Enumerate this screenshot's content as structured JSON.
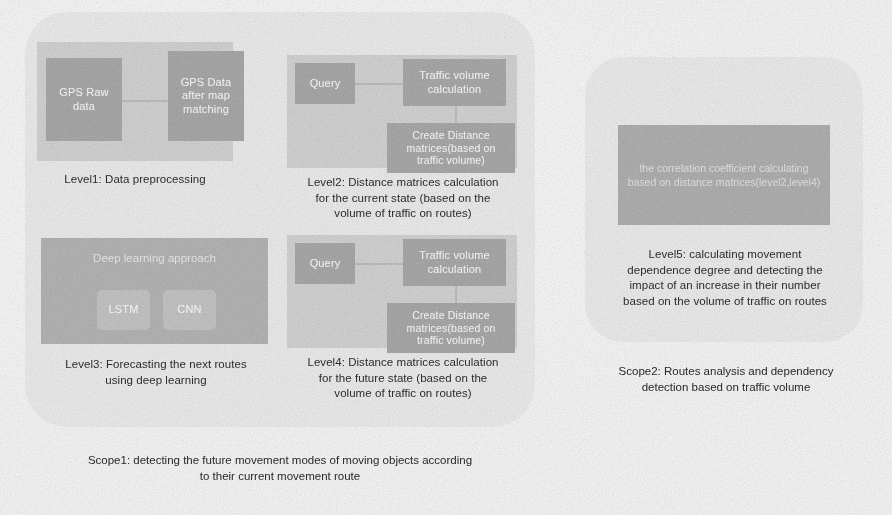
{
  "scope1": {
    "caption_line1": "Scope1: detecting the future movement modes of moving objects according",
    "caption_line2": "to their current movement route",
    "levels": [
      {
        "id": "level1",
        "caption": "Level1: Data preprocessing",
        "nodes": [
          {
            "id": "gps-raw-data",
            "line1": "GPS Raw",
            "line2": "data"
          },
          {
            "id": "gps-data-after-map-matching",
            "line1": "GPS Data",
            "line2": "after map",
            "line3": "matching"
          }
        ]
      },
      {
        "id": "level2",
        "caption_line1": "Level2: Distance matrices calculation",
        "caption_line2": "for the current state (based on the",
        "caption_line3": "volume of traffic on routes)",
        "nodes": [
          {
            "id": "query",
            "line1": "Query"
          },
          {
            "id": "traffic-volume-calculation",
            "line1": "Traffic volume",
            "line2": "calculation"
          },
          {
            "id": "create-distance-matrices",
            "line1": "Create Distance",
            "line2": "matrices(based on",
            "line3": "traffic volume)"
          }
        ]
      },
      {
        "id": "level3",
        "caption_line1": "Level3: Forecasting the next routes",
        "caption_line2": "using deep learning",
        "container_label": "Deep learning approach",
        "nodes": [
          {
            "id": "lstm",
            "line1": "LSTM"
          },
          {
            "id": "cnn",
            "line1": "CNN"
          }
        ]
      },
      {
        "id": "level4",
        "caption_line1": "Level4: Distance matrices calculation",
        "caption_line2": "for the future state (based on the",
        "caption_line3": "volume of traffic on routes)",
        "nodes": [
          {
            "id": "query",
            "line1": "Query"
          },
          {
            "id": "traffic-volume-calculation",
            "line1": "Traffic volume",
            "line2": "calculation"
          },
          {
            "id": "create-distance-matrices",
            "line1": "Create Distance",
            "line2": "matrices(based on",
            "line3": "traffic volume)"
          }
        ]
      }
    ]
  },
  "scope2": {
    "caption_line1": "Scope2: Routes analysis and dependency",
    "caption_line2": "detection based on traffic volume",
    "level5": {
      "node_line1": "the correlation coefficient calculating",
      "node_line2": "based on distance matrices(level2,level4)",
      "caption_line1": "Level5: calculating movement",
      "caption_line2": "dependence degree and detecting the",
      "caption_line3": "impact of an increase in their number",
      "caption_line4": "based on the volume of traffic on routes"
    }
  },
  "colors": {
    "page_background": "#ffffff",
    "scope_panel": "#f2f2f2",
    "level_container": "#d8d8d8",
    "level_container_dark": "#b9b9b9",
    "node_fill": "#adadad",
    "node_fill_light": "#c9c9c9",
    "node_text": "#fdfdfd",
    "caption_text": "#2e2e2e",
    "connector": "#c2c2c2"
  }
}
